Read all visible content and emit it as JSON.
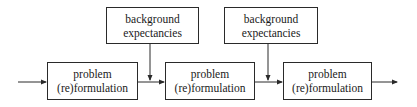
{
  "diagram": {
    "top_boxes": [
      {
        "line1": "background",
        "line2": "expectancies"
      },
      {
        "line1": "background",
        "line2": "expectancies"
      }
    ],
    "process_boxes": [
      {
        "line1": "problem",
        "line2": "(re)formulation"
      },
      {
        "line1": "problem",
        "line2": "(re)formulation"
      },
      {
        "line1": "problem",
        "line2": "(re)formulation"
      }
    ],
    "colors": {
      "line": "#2a2a2a",
      "background": "#ffffff"
    }
  }
}
